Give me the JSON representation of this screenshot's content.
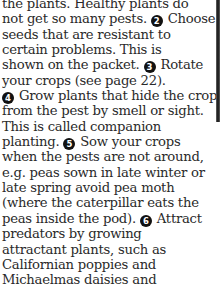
{
  "document": {
    "paragraph": {
      "lines": [
        {
          "pre": "the plants. Healthy plants do",
          "num": "",
          "post": ""
        },
        {
          "pre": "not get so many pests. ",
          "num": "2",
          "post": " Choose"
        },
        {
          "pre": "seeds that are resistant to",
          "num": "",
          "post": ""
        },
        {
          "pre": "certain problems. This is",
          "num": "",
          "post": ""
        },
        {
          "pre": "shown on the packet. ",
          "num": "3",
          "post": " Rotate"
        },
        {
          "pre": "your crops (see page 22).",
          "num": "",
          "post": ""
        },
        {
          "pre": "",
          "num": "4",
          "post": " Grow plants that hide the crop"
        },
        {
          "pre": "from the pest by smell or sight.",
          "num": "",
          "post": ""
        },
        {
          "pre": "This is called companion",
          "num": "",
          "post": ""
        },
        {
          "pre": "planting. ",
          "num": "5",
          "post": " Sow your crops"
        },
        {
          "pre": "when the pests are not around,",
          "num": "",
          "post": ""
        },
        {
          "pre": "e.g. peas sown in late winter or",
          "num": "",
          "post": ""
        },
        {
          "pre": "late spring avoid pea moth",
          "num": "",
          "post": ""
        },
        {
          "pre": "(where the caterpillar eats the",
          "num": "",
          "post": ""
        },
        {
          "pre": "peas inside the pod). ",
          "num": "6",
          "post": " Attract"
        },
        {
          "pre": "predators by growing",
          "num": "",
          "post": ""
        },
        {
          "pre": "attractant plants, such as",
          "num": "",
          "post": ""
        },
        {
          "pre": "Californian poppies and",
          "num": "",
          "post": ""
        },
        {
          "pre": "Michaelmas daisies and",
          "num": "",
          "post": ""
        }
      ]
    }
  },
  "colors": {
    "text": "#2a2a2a",
    "badge_bg": "#111111",
    "badge_fg": "#ffffff",
    "background": "#ffffff"
  }
}
